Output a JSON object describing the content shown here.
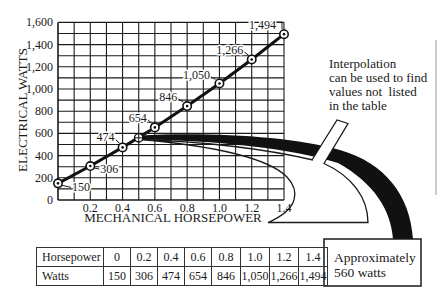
{
  "chart_data": {
    "type": "line",
    "title": "",
    "xlabel": "MECHANICAL HORSEPOWER",
    "ylabel": "ELECTRICAL WATTS",
    "xlim": [
      0,
      1.4
    ],
    "ylim": [
      0,
      1600
    ],
    "grid": true,
    "x_grid_step": 0.1,
    "y_grid_step": 100,
    "x_ticks": [
      {
        "value": 0.2,
        "label": "0.2"
      },
      {
        "value": 0.4,
        "label": "0.4"
      },
      {
        "value": 0.6,
        "label": "0.6"
      },
      {
        "value": 0.8,
        "label": "0.8"
      },
      {
        "value": 1.0,
        "label": "1.0"
      },
      {
        "value": 1.2,
        "label": "1.2"
      },
      {
        "value": 1.4,
        "label": "1.4"
      }
    ],
    "y_ticks": [
      {
        "value": 0,
        "label": "0"
      },
      {
        "value": 200,
        "label": "200"
      },
      {
        "value": 400,
        "label": "400"
      },
      {
        "value": 600,
        "label": "600"
      },
      {
        "value": 800,
        "label": "800"
      },
      {
        "value": 1000,
        "label": "1,000"
      },
      {
        "value": 1200,
        "label": "1,200"
      },
      {
        "value": 1400,
        "label": "1,400"
      },
      {
        "value": 1600,
        "label": "1,600"
      }
    ],
    "series": [
      {
        "name": "Watts",
        "x": [
          0,
          0.2,
          0.4,
          0.6,
          0.8,
          1.0,
          1.2,
          1.4
        ],
        "y": [
          150,
          306,
          474,
          654,
          846,
          1050,
          1266,
          1494
        ],
        "labels": [
          "150",
          "306",
          "474",
          "654",
          "846",
          "1,050",
          "1,266",
          "1,494"
        ]
      }
    ],
    "interpolated_point": {
      "x": 0.5,
      "y": 560,
      "marker": "crossed-circle"
    },
    "annotations": [
      "Interpolation can be used to find values not listed in the table",
      "Approximately 560 watts"
    ]
  },
  "callout": {
    "lines": [
      "Interpolation",
      "can be used to find",
      "values not  listed",
      "in the table"
    ]
  },
  "result_box": {
    "lines": [
      "Approximately",
      "560 watts"
    ]
  },
  "table": {
    "rows": [
      {
        "header": "Horsepower",
        "cells": [
          "0",
          "0.2",
          "0.4",
          "0.6",
          "0.8",
          "1.0",
          "1.2",
          "1.4"
        ]
      },
      {
        "header": "Watts",
        "cells": [
          "150",
          "306",
          "474",
          "654",
          "846",
          "1,050",
          "1,266",
          "1,494"
        ]
      }
    ]
  },
  "colors": {
    "ink": "#1a1a1a",
    "paper": "#ffffff"
  }
}
